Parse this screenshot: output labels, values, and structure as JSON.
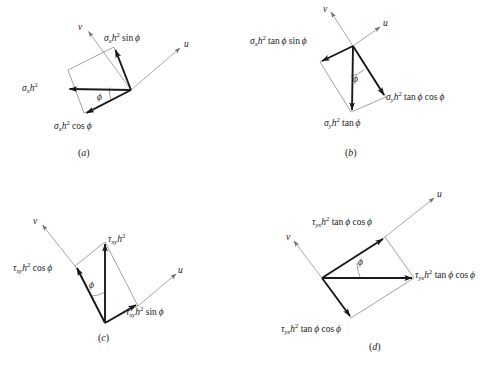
{
  "figure": {
    "colors": {
      "vector": "#1a1a1a",
      "axis": "#9a9a9a",
      "outline": "#8c8c8c",
      "arc": "#8c8c8c",
      "background": "#ffffff"
    },
    "axis_labels": {
      "u": "u",
      "v": "v"
    },
    "angle_symbol": "ϕ"
  },
  "panels": [
    {
      "id": "a",
      "caption_open": "(",
      "caption_letter": "a",
      "caption_close": ")",
      "stress_symbol": "σ",
      "subscript": "x",
      "base_term": "h",
      "exponent": "2",
      "labels": {
        "resultant": {
          "full": "σx h²",
          "trig": ""
        },
        "component_1": {
          "full": "σx h² sin ϕ",
          "trig": "sin ϕ"
        },
        "component_2": {
          "full": "σx h² cos ϕ",
          "trig": "cos ϕ"
        }
      }
    },
    {
      "id": "b",
      "caption_open": "(",
      "caption_letter": "b",
      "caption_close": ")",
      "stress_symbol": "σ",
      "subscript": "y",
      "base_term": "h",
      "exponent": "2",
      "labels": {
        "resultant": {
          "full": "σy h² tan ϕ",
          "trig": "tan ϕ"
        },
        "component_1": {
          "full": "σy h² tan ϕ sin ϕ",
          "trig": "tan ϕ sin ϕ"
        },
        "component_2": {
          "full": "σy h² tan ϕ cos ϕ",
          "trig": "tan ϕ cos ϕ"
        }
      }
    },
    {
      "id": "c",
      "caption_open": "(",
      "caption_letter": "c",
      "caption_close": ")",
      "stress_symbol": "τ",
      "subscript": "xy",
      "base_term": "h",
      "exponent": "2",
      "labels": {
        "resultant": {
          "full": "τxy h²",
          "trig": ""
        },
        "component_1": {
          "full": "τxy h² cos ϕ",
          "trig": "cos ϕ"
        },
        "component_2": {
          "full": "τxy h² sin ϕ",
          "trig": "sin ϕ"
        }
      }
    },
    {
      "id": "d",
      "caption_open": "(",
      "caption_letter": "d",
      "caption_close": ")",
      "stress_symbol": "τ",
      "subscript": "yx",
      "base_term": "h",
      "exponent": "2",
      "labels": {
        "resultant": {
          "full": "τyx h² tan ϕ cos ϕ",
          "trig": "tan ϕ cos ϕ"
        },
        "component_1": {
          "full": "τyx h² tan ϕ cos ϕ",
          "trig": "tan ϕ cos ϕ"
        },
        "component_2": {
          "full": "τyx h² tan ϕ cos ϕ",
          "trig": "tan ϕ cos ϕ"
        }
      }
    }
  ],
  "text": {
    "sigma": "σ",
    "tau": "τ",
    "phi": "ϕ",
    "h": "h",
    "sq": "2",
    "sin": "sin",
    "cos": "cos",
    "tan": "tan",
    "sub_x": "x",
    "sub_y": "y",
    "sub_xy": "xy",
    "sub_yx": "yx",
    "u": "u",
    "v": "v",
    "cap_a": "a",
    "cap_b": "b",
    "cap_c": "c",
    "cap_d": "d",
    "paren_open": "(",
    "paren_close": ")"
  }
}
